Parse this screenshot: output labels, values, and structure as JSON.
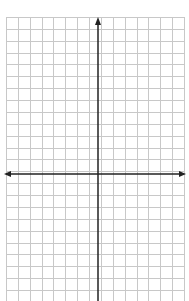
{
  "diagram": {
    "type": "coordinate-plane-grid",
    "grid": {
      "left": 6,
      "top": 17,
      "right": 184,
      "bottom": 301,
      "cell_size": 11.87,
      "columns": 15,
      "line_color": "#c8c8c8"
    },
    "axes": {
      "x_axis_y": 174,
      "y_axis_x": 98,
      "color": "#222222",
      "x_arrows": [
        "left",
        "right"
      ],
      "y_arrows": [
        "up"
      ]
    },
    "labels": []
  }
}
